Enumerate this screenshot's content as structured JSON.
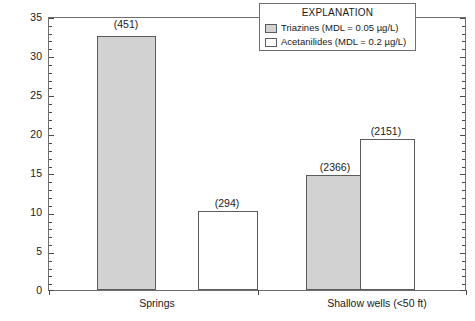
{
  "chart_data": {
    "type": "bar",
    "title": "",
    "xlabel": "",
    "ylabel": "Frequency of Herbicide Detection, in Percent",
    "ylim": [
      0,
      35
    ],
    "ytick_step": 5,
    "yminor_step": 1,
    "grid": false,
    "legend_position": "top-right",
    "categories": [
      "Springs",
      "Shallow wells (<50 ft)"
    ],
    "series": [
      {
        "name": "Triazines (MDL = 0.05 µg/L)",
        "fill": "#d2d2d2",
        "values": [
          32.4,
          14.7
        ],
        "point_labels": [
          "(451)",
          "(2366)"
        ]
      },
      {
        "name": "Acetanilides (MDL = 0.2 µg/L)",
        "fill": "#ffffff",
        "values": [
          10.1,
          19.3
        ],
        "point_labels": [
          "(294)",
          "(2151)"
        ]
      }
    ],
    "ytick_labels": [
      "0",
      "5",
      "10",
      "15",
      "20",
      "25",
      "30",
      "35"
    ]
  },
  "axes": {
    "y_title": "Frequency of Herbicide Detection, in Percent",
    "y_ticks": [
      {
        "value": 35,
        "label": "35"
      },
      {
        "value": 30,
        "label": "30"
      },
      {
        "value": 25,
        "label": "25"
      },
      {
        "value": 20,
        "label": "20"
      },
      {
        "value": 15,
        "label": "15"
      },
      {
        "value": 10,
        "label": "10"
      },
      {
        "value": 5,
        "label": "5"
      },
      {
        "value": 0,
        "label": "0"
      }
    ],
    "x_categories": [
      {
        "label": "Springs"
      },
      {
        "label": "Shallow wells (<50 ft)"
      }
    ]
  },
  "bars": [
    {
      "id": "springs-triazines",
      "label": "(451)",
      "value": 32.4,
      "fill": "gray"
    },
    {
      "id": "springs-acetanilides",
      "label": "(294)",
      "value": 10.1,
      "fill": "white"
    },
    {
      "id": "shallowwells-triazines",
      "label": "(2366)",
      "value": 14.7,
      "fill": "gray"
    },
    {
      "id": "shallowwells-acetanilides",
      "label": "(2151)",
      "value": 19.3,
      "fill": "white"
    }
  ],
  "legend": {
    "title": "EXPLANATION",
    "entries": [
      {
        "label": "Triazines (MDL = 0.05 µg/L)",
        "fill": "gray"
      },
      {
        "label": "Acetanilides (MDL = 0.2 µg/L)",
        "fill": "white"
      }
    ]
  },
  "colors": {
    "series_gray": "#d2d2d2",
    "series_white": "#ffffff",
    "axis": "#6e6e6e",
    "text": "#1a1a1a"
  }
}
